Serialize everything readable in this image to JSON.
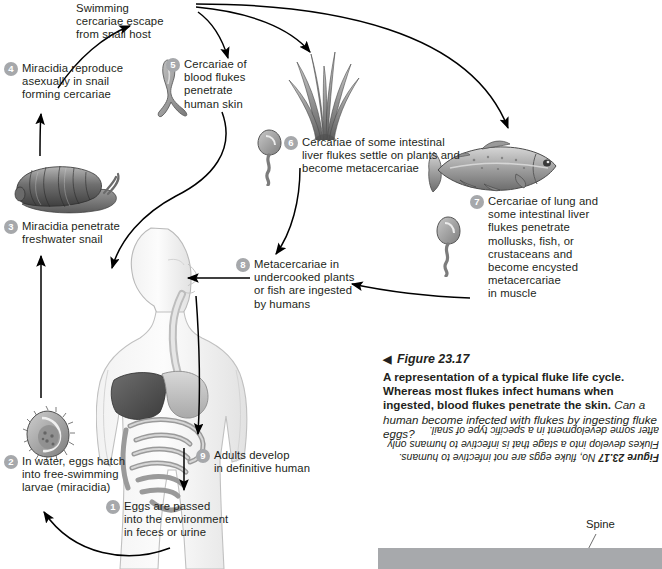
{
  "figure": {
    "number": "Figure 23.17",
    "pointer_glyph": "◀",
    "caption_bold": "A representation of a typical fluke life cycle. Whereas most flukes infect humans when ingested, blood flukes penetrate the skin.",
    "caption_question": "Can a human become infected with flukes by ingesting fluke eggs?",
    "answer_label": "Figure 23.17",
    "answer_text": "No, fluke eggs are not infective to humans. Flukes develop into a stage that is infective to humans only after some development in a specific type of snail."
  },
  "headline": "Swimming\ncercariae escape\nfrom snail host",
  "spine": {
    "label": "Spine",
    "bar_color": "#a7a9ac"
  },
  "colors": {
    "badge": "#a6a8ab",
    "text": "#231f20",
    "arrow": "#000000"
  },
  "steps": [
    {
      "n": "1",
      "text": "Eggs are passed\ninto the environment\nin feces or urine"
    },
    {
      "n": "2",
      "text": "In water, eggs hatch\ninto free-swimming\nlarvae (miracidia)"
    },
    {
      "n": "3",
      "text": "Miracidia penetrate\nfreshwater snail"
    },
    {
      "n": "4",
      "text": "Miracidia reproduce\nasexually in snail\nforming cercariae"
    },
    {
      "n": "5",
      "text": "Cercariae of\nblood flukes\npenetrate\nhuman skin"
    },
    {
      "n": "6",
      "text": "Cercariae of some intestinal\nliver flukes settle on plants and\nbecome metacercariae"
    },
    {
      "n": "7",
      "text": "Cercariae of lung and\nsome intestinal liver\nflukes penetrate\nmollusks, fish, or\ncrustaceans and\nbecome encysted\nmetacercariae\nin muscle"
    },
    {
      "n": "8",
      "text": "Metacercariae in\nundercooked plants\nor fish are ingested\nby humans"
    },
    {
      "n": "9",
      "text": "Adults develop\nin definitive human"
    }
  ],
  "illustrations": [
    {
      "name": "snail",
      "caption": "freshwater snail"
    },
    {
      "name": "miracidium",
      "caption": "ciliated larva"
    },
    {
      "name": "forked-cercaria",
      "caption": "blood fluke cercaria"
    },
    {
      "name": "aquatic-plant",
      "caption": "water plant"
    },
    {
      "name": "single-tail-cercaria",
      "caption": "cercaria"
    },
    {
      "name": "fish",
      "caption": "trout"
    },
    {
      "name": "human-body",
      "caption": "human digestive anatomy"
    }
  ]
}
